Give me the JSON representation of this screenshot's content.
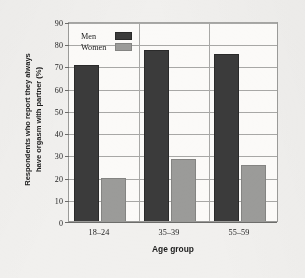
{
  "chart_data": {
    "type": "bar",
    "title": "",
    "categories": [
      "18–24",
      "35–39",
      "55–59"
    ],
    "series": [
      {
        "name": "Men",
        "values": [
          70,
          77,
          75
        ],
        "color": "#3b3b3b"
      },
      {
        "name": "Women",
        "values": [
          19.5,
          28,
          25
        ],
        "color": "#9b9b99"
      }
    ],
    "xlabel": "Age group",
    "ylabel_lines": [
      "Respondents who report they always",
      "have orgasm with partner (%)"
    ],
    "ylabel": "Respondents who report they always have orgasm with partner (%)",
    "ylim": [
      0,
      90
    ],
    "ytick_step": 10,
    "yticks": [
      "0",
      "10",
      "20",
      "30",
      "40",
      "50",
      "60",
      "70",
      "80",
      "90"
    ],
    "grid": true,
    "grid_axis": "y",
    "legend_position": "upper left inside plot",
    "legend": [
      "Men",
      "Women"
    ]
  },
  "axis": {
    "y_ticks": [
      {
        "value": 90,
        "label": "90"
      },
      {
        "value": 80,
        "label": "80"
      },
      {
        "value": 70,
        "label": "70"
      },
      {
        "value": 60,
        "label": "60"
      },
      {
        "value": 50,
        "label": "50"
      },
      {
        "value": 40,
        "label": "40"
      },
      {
        "value": 30,
        "label": "30"
      },
      {
        "value": 20,
        "label": "20"
      },
      {
        "value": 10,
        "label": "10"
      },
      {
        "value": 0,
        "label": "0"
      }
    ]
  },
  "legend": {
    "men_label": "Men",
    "women_label": "Women"
  },
  "xaxis": {
    "title": "Age group",
    "categories": [
      "18–24",
      "35–39",
      "55–59"
    ]
  },
  "yaxis": {
    "title_line1": "Respondents who report they always",
    "title_line2": "have orgasm with partner (%)"
  }
}
